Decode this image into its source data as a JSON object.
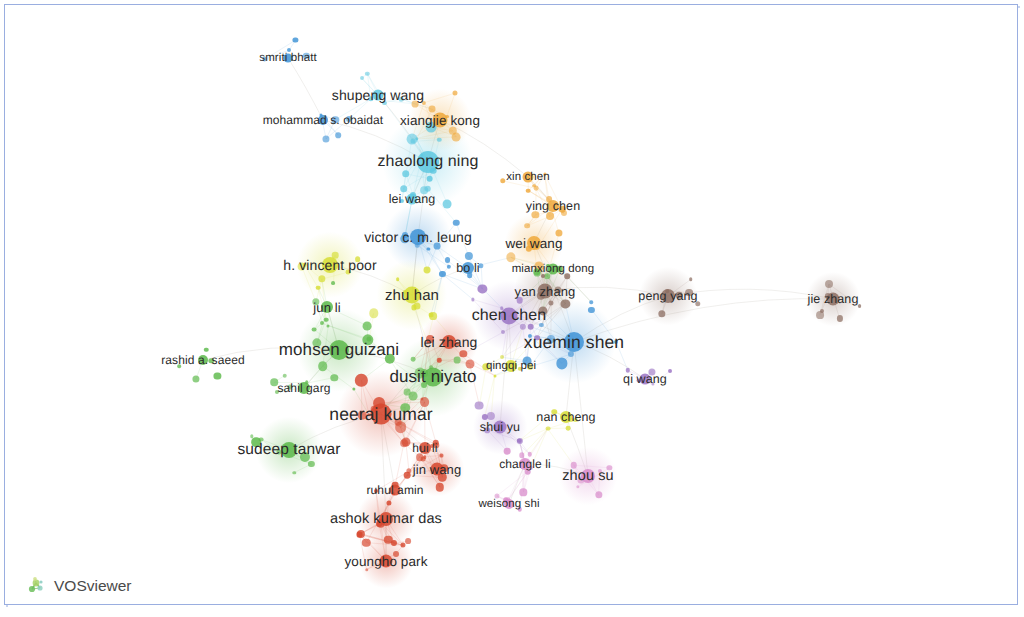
{
  "app": {
    "name": "VOSviewer",
    "logo_icon": "vosviewer-network-logo-icon"
  },
  "frame": {
    "border_color": "#9aaee0",
    "background": "#ffffff"
  },
  "chart_data": {
    "type": "scatter",
    "title": "",
    "subtitle": "",
    "xlabel": "",
    "ylabel": "",
    "grid": false,
    "legend_position": "none",
    "clusters": [
      {
        "id": 1,
        "name": "green",
        "color": "#5cb94a"
      },
      {
        "id": 2,
        "name": "yellow",
        "color": "#d6dd34"
      },
      {
        "id": 3,
        "name": "red",
        "color": "#d6472e"
      },
      {
        "id": 4,
        "name": "blue",
        "color": "#3f93d6"
      },
      {
        "id": 5,
        "name": "cyan",
        "color": "#5ec8e0"
      },
      {
        "id": 6,
        "name": "orange",
        "color": "#efa83a"
      },
      {
        "id": 7,
        "name": "purple",
        "color": "#9b74c4"
      },
      {
        "id": 8,
        "name": "magenta",
        "color": "#d98ccb"
      },
      {
        "id": 9,
        "name": "brown",
        "color": "#8d6f63"
      }
    ],
    "labeled_nodes": [
      {
        "label": "smriti bhatt",
        "x": 288,
        "y": 58,
        "size": 9,
        "cluster": "blue",
        "font": 11.5
      },
      {
        "label": "shupeng wang",
        "x": 378,
        "y": 95,
        "size": 11,
        "cluster": "cyan",
        "font": 14
      },
      {
        "label": "mohammad s. obaidat",
        "x": 323,
        "y": 120,
        "size": 10,
        "cluster": "blue",
        "font": 12
      },
      {
        "label": "xiangjie kong",
        "x": 440,
        "y": 120,
        "size": 15,
        "cluster": "orange",
        "font": 13.5
      },
      {
        "label": "zhaolong ning",
        "x": 428,
        "y": 162,
        "size": 22,
        "cluster": "cyan",
        "font": 16
      },
      {
        "label": "xin chen",
        "x": 528,
        "y": 177,
        "size": 11,
        "cluster": "orange",
        "font": 11.5
      },
      {
        "label": "lei wang",
        "x": 412,
        "y": 199,
        "size": 11,
        "cluster": "cyan",
        "font": 12.5
      },
      {
        "label": "ying chen",
        "x": 553,
        "y": 206,
        "size": 12,
        "cluster": "orange",
        "font": 12.5
      },
      {
        "label": "victor c. m. leung",
        "x": 418,
        "y": 237,
        "size": 16,
        "cluster": "blue",
        "font": 14
      },
      {
        "label": "wei wang",
        "x": 534,
        "y": 243,
        "size": 14,
        "cluster": "orange",
        "font": 13.5
      },
      {
        "label": "h. vincent poor",
        "x": 330,
        "y": 265,
        "size": 16,
        "cluster": "yellow",
        "font": 14
      },
      {
        "label": "bo li",
        "x": 468,
        "y": 268,
        "size": 12,
        "cluster": "blue",
        "font": 12.5
      },
      {
        "label": "mianxiong dong",
        "x": 553,
        "y": 269,
        "size": 11,
        "cluster": "green",
        "font": 11.5
      },
      {
        "label": "zhu han",
        "x": 412,
        "y": 295,
        "size": 17,
        "cluster": "yellow",
        "font": 15
      },
      {
        "label": "yan zhang",
        "x": 545,
        "y": 291,
        "size": 15,
        "cluster": "brown",
        "font": 13
      },
      {
        "label": "jun li",
        "x": 327,
        "y": 307,
        "size": 12,
        "cluster": "green",
        "font": 13
      },
      {
        "label": "peng yang",
        "x": 668,
        "y": 296,
        "size": 14,
        "cluster": "brown",
        "font": 12.5
      },
      {
        "label": "jie zhang",
        "x": 833,
        "y": 299,
        "size": 13,
        "cluster": "brown",
        "font": 12.5
      },
      {
        "label": "chen chen",
        "x": 509,
        "y": 316,
        "size": 17,
        "cluster": "purple",
        "font": 16
      },
      {
        "label": "rashid a. saeed",
        "x": 203,
        "y": 360,
        "size": 10,
        "cluster": "green",
        "font": 12
      },
      {
        "label": "mohsen guizani",
        "x": 339,
        "y": 350,
        "size": 20,
        "cluster": "green",
        "font": 17
      },
      {
        "label": "lei zhang",
        "x": 449,
        "y": 342,
        "size": 14,
        "cluster": "red",
        "font": 14
      },
      {
        "label": "xuemin shen",
        "x": 574,
        "y": 342,
        "size": 20,
        "cluster": "blue",
        "font": 17.5
      },
      {
        "label": "dusit niyato",
        "x": 433,
        "y": 377,
        "size": 19,
        "cluster": "green",
        "font": 17
      },
      {
        "label": "qingqi pei",
        "x": 511,
        "y": 366,
        "size": 12,
        "cluster": "yellow",
        "font": 11.5
      },
      {
        "label": "qi wang",
        "x": 645,
        "y": 379,
        "size": 11,
        "cluster": "purple",
        "font": 12.5
      },
      {
        "label": "sahil garg",
        "x": 304,
        "y": 388,
        "size": 12,
        "cluster": "green",
        "font": 12
      },
      {
        "label": "neeraj kumar",
        "x": 381,
        "y": 414,
        "size": 21,
        "cluster": "red",
        "font": 17.5
      },
      {
        "label": "nan cheng",
        "x": 566,
        "y": 417,
        "size": 12,
        "cluster": "yellow",
        "font": 12.5
      },
      {
        "label": "shui yu",
        "x": 500,
        "y": 427,
        "size": 13,
        "cluster": "purple",
        "font": 12.5
      },
      {
        "label": "sudeep tanwar",
        "x": 289,
        "y": 450,
        "size": 16,
        "cluster": "green",
        "font": 15.5
      },
      {
        "label": "hui li",
        "x": 425,
        "y": 448,
        "size": 12,
        "cluster": "red",
        "font": 12
      },
      {
        "label": "changle li",
        "x": 525,
        "y": 464,
        "size": 12,
        "cluster": "magenta",
        "font": 12
      },
      {
        "label": "jin wang",
        "x": 437,
        "y": 469,
        "size": 13,
        "cluster": "red",
        "font": 13
      },
      {
        "label": "zhou su",
        "x": 588,
        "y": 476,
        "size": 14,
        "cluster": "magenta",
        "font": 14.5
      },
      {
        "label": "ruhul amin",
        "x": 395,
        "y": 490,
        "size": 11,
        "cluster": "red",
        "font": 12
      },
      {
        "label": "weisong shi",
        "x": 509,
        "y": 504,
        "size": 10,
        "cluster": "magenta",
        "font": 11.5
      },
      {
        "label": "ashok kumar das",
        "x": 386,
        "y": 519,
        "size": 14,
        "cluster": "red",
        "font": 14.5
      },
      {
        "label": "youngho park",
        "x": 386,
        "y": 561,
        "size": 13,
        "cluster": "red",
        "font": 13.5
      }
    ]
  }
}
